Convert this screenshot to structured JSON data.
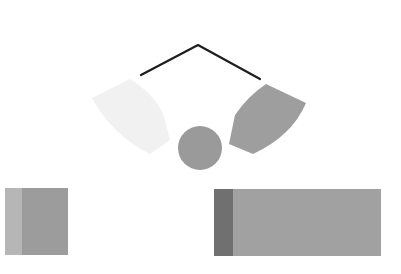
{
  "canvas": {
    "width": 401,
    "height": 274,
    "background": "#ffffff"
  },
  "shapes": {
    "chevron": {
      "points": "141,75 198,45 260,79",
      "stroke": "#1e1e1e",
      "stroke_width": 2.2
    },
    "left_arc_segment": {
      "path": "M92,98 L130,79 Q152,92 163,113 L170,140 L150,154 Q112,135 92,98 Z",
      "fill": "#f1f1f1"
    },
    "right_arc_segment": {
      "path": "M266,84 L306,103 Q292,136 253,154 L229,144 L235,115 Q248,96 266,84 Z",
      "fill": "#9e9e9e"
    },
    "center_circle": {
      "cx": 200,
      "cy": 148,
      "r": 22,
      "fill": "#9a9a9a"
    },
    "left_block": {
      "x": 5,
      "y": 188,
      "width": 63,
      "height": 67,
      "fill": "#9c9c9c",
      "strip": {
        "width": 17,
        "fill": "#b6b6b6"
      }
    },
    "right_block": {
      "x": 214,
      "y": 189,
      "width": 167,
      "height": 67,
      "fill": "#a1a1a1",
      "strip": {
        "width": 19,
        "fill": "#707070"
      }
    }
  }
}
